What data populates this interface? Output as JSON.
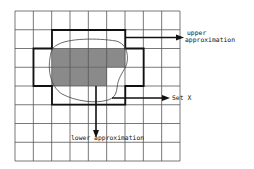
{
  "diagram": {
    "grid": {
      "left": 15,
      "top": 11,
      "right": 180,
      "bottom": 161,
      "cols": 9,
      "rows": 8,
      "line_color": "#555555"
    },
    "colors": {
      "shade": "#8a8a8a",
      "thick_border": "#111111",
      "curve": "#444444",
      "arrow": "#111111"
    },
    "labels": {
      "upper_line1": "upper",
      "upper_line2": "approximation",
      "set_x": "Set X",
      "lower": "lower approximation"
    },
    "regions": {
      "lower_approximation_cells": [
        {
          "row": 2,
          "col": 2
        },
        {
          "row": 2,
          "col": 3
        },
        {
          "row": 2,
          "col": 4
        },
        {
          "row": 2,
          "col": 5
        },
        {
          "row": 3,
          "col": 2
        },
        {
          "row": 3,
          "col": 3
        },
        {
          "row": 3,
          "col": 4
        }
      ],
      "upper_approximation_outline": "cols 2-5 rows 1-4 plus cols 1-6 rows 2-3"
    }
  }
}
